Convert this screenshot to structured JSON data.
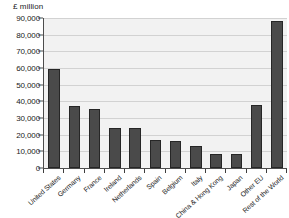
{
  "chart_data": {
    "type": "bar",
    "title": "",
    "subtitle": "",
    "unit_label": "£ million",
    "xlabel": "",
    "ylabel": "£ million",
    "ylim": [
      0,
      90000
    ],
    "ytick_values": [
      0,
      10000,
      20000,
      30000,
      40000,
      50000,
      60000,
      70000,
      80000,
      90000
    ],
    "ytick_labels": [
      "0",
      "10,000",
      "20,000",
      "30,000",
      "40,000",
      "50,000",
      "60,000",
      "70,000",
      "80,000",
      "90,000"
    ],
    "grid": true,
    "legend": false,
    "legend_position": "none",
    "bar_color": "#4a4a4a",
    "bar_edge_color": "#262626",
    "plot_background": "#f2f2f2",
    "axis_color": "#4d4d4d",
    "gridline_color": "#d2d2d2",
    "categories": [
      "United States",
      "Germany",
      "France",
      "Ireland",
      "Netherlands",
      "Spain",
      "Belgium",
      "Italy",
      "China & Hong Kong",
      "Japan",
      "Other EU",
      "Rest of the World"
    ],
    "values": [
      59400,
      37000,
      35700,
      24300,
      24000,
      16700,
      16300,
      13000,
      8700,
      8200,
      37900,
      88200
    ]
  }
}
